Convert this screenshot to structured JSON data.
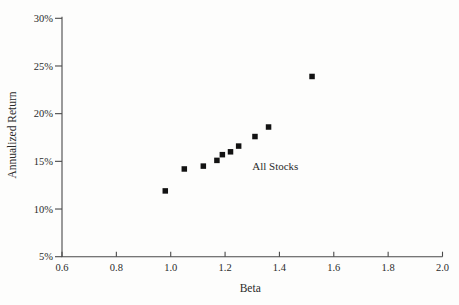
{
  "figure": {
    "background": "#fdfdfc",
    "ink": "#2b2b2b",
    "axis_color": "#4a4a4a",
    "marker_color": "#121212"
  },
  "chart_data": {
    "type": "scatter",
    "title": "",
    "xlabel": "Beta",
    "ylabel": "Annualized Return",
    "xlim": [
      0.6,
      2.0
    ],
    "ylim": [
      5,
      30
    ],
    "grid": false,
    "legend": "none",
    "marker": "filled-square",
    "x_ticks": [
      0.6,
      0.8,
      1.0,
      1.2,
      1.4,
      1.6,
      1.8,
      2.0
    ],
    "x_tick_labels": [
      "0.6",
      "0.8",
      "1.0",
      "1.2",
      "1.4",
      "1.6",
      "1.8",
      "2.0"
    ],
    "y_ticks": [
      5,
      10,
      15,
      20,
      25,
      30
    ],
    "y_tick_labels": [
      "5%",
      "10%",
      "15%",
      "20%",
      "25%",
      "30%"
    ],
    "series": [
      {
        "name": "All Stocks",
        "points": [
          {
            "beta": 0.98,
            "annualized_return_pct": 11.9
          },
          {
            "beta": 1.05,
            "annualized_return_pct": 14.2
          },
          {
            "beta": 1.12,
            "annualized_return_pct": 14.5
          },
          {
            "beta": 1.17,
            "annualized_return_pct": 15.1
          },
          {
            "beta": 1.19,
            "annualized_return_pct": 15.7
          },
          {
            "beta": 1.22,
            "annualized_return_pct": 16.0
          },
          {
            "beta": 1.25,
            "annualized_return_pct": 16.6
          },
          {
            "beta": 1.31,
            "annualized_return_pct": 17.6
          },
          {
            "beta": 1.36,
            "annualized_return_pct": 18.6
          },
          {
            "beta": 1.52,
            "annualized_return_pct": 23.9
          }
        ]
      }
    ],
    "annotations": [
      {
        "text": "All Stocks",
        "x": 1.3,
        "y": 14.05,
        "anchor": "start"
      }
    ]
  }
}
